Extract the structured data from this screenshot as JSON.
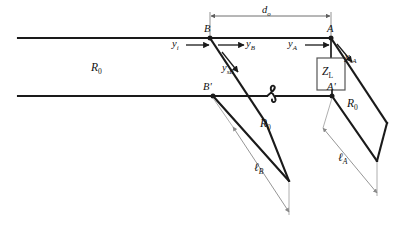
{
  "figure": {
    "type": "double-stub-tuner-transmission-line-diagram",
    "line_char_impedance": "R",
    "line_char_impedance_sub": "0"
  },
  "labels": {
    "main_line_R0": {
      "base": "R",
      "sub": "0"
    },
    "stub_B_R0": {
      "base": "R",
      "sub": "0"
    },
    "stub_A_R0": {
      "base": "R",
      "sub": "0"
    },
    "d_o": {
      "base": "d",
      "sub": "o"
    },
    "y_i": {
      "base": "y",
      "sub": "i"
    },
    "y_B": {
      "base": "y",
      "sub": "B"
    },
    "y_A": {
      "base": "y",
      "sub": "A"
    },
    "y_sB": {
      "base": "y",
      "sub": "sB"
    },
    "y_sA": {
      "base": "y",
      "sub": "sA"
    },
    "l_B": {
      "base": "ℓ",
      "sub": "B"
    },
    "l_A": {
      "base": "ℓ",
      "sub": "A"
    },
    "Z_L": {
      "base": "Z",
      "sub": "L"
    },
    "point_B": "B",
    "point_B_prime": "B'",
    "point_A": "A",
    "point_A_prime": "A'"
  },
  "colors": {
    "conductor": "#1a1a1a",
    "dimension": "#666666",
    "leader": "#8a8a8a",
    "text": "#111111",
    "background": "#ffffff"
  },
  "geometry": {
    "top_line_y": 38,
    "bottom_line_y": 96,
    "line_left_x": 18,
    "B_x": 210,
    "A_x": 331,
    "dimension_y": 16,
    "stub_dx": 56,
    "stub_dy": 85
  }
}
